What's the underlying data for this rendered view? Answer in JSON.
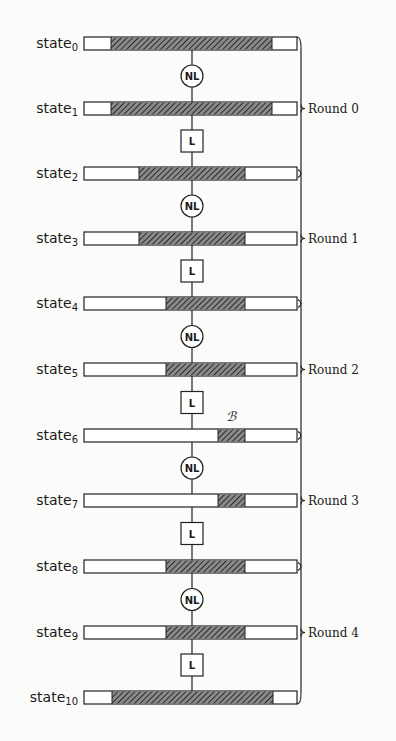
{
  "diagram": {
    "title": "",
    "layout": {
      "bar_x": 84,
      "bar_width": 213,
      "bar_height": 13,
      "center_x": 192,
      "brace_x": 301
    },
    "colors": {
      "stroke": "#222222",
      "hatch_bg": "#8a8a8a",
      "hatch_line": "#2a2a2a",
      "bar_fill": "#ffffff"
    },
    "states": [
      {
        "label": "state",
        "sub": "0",
        "y": 37,
        "hatch": [
          111,
          272
        ]
      },
      {
        "label": "state",
        "sub": "1",
        "y": 102,
        "hatch": [
          111,
          272
        ]
      },
      {
        "label": "state",
        "sub": "2",
        "y": 167,
        "hatch": [
          139,
          245
        ]
      },
      {
        "label": "state",
        "sub": "3",
        "y": 232,
        "hatch": [
          139,
          245
        ]
      },
      {
        "label": "state",
        "sub": "4",
        "y": 297,
        "hatch": [
          166,
          245
        ]
      },
      {
        "label": "state",
        "sub": "5",
        "y": 363,
        "hatch": [
          166,
          245
        ]
      },
      {
        "label": "state",
        "sub": "6",
        "y": 429,
        "hatch": [
          218,
          245
        ]
      },
      {
        "label": "state",
        "sub": "7",
        "y": 494,
        "hatch": [
          218,
          245
        ]
      },
      {
        "label": "state",
        "sub": "8",
        "y": 560,
        "hatch": [
          166,
          245
        ]
      },
      {
        "label": "state",
        "sub": "9",
        "y": 626,
        "hatch": [
          166,
          245
        ]
      },
      {
        "label": "state",
        "sub": "10",
        "y": 691,
        "hatch": [
          112,
          273
        ]
      }
    ],
    "operations": [
      {
        "type": "NL",
        "between": [
          0,
          1
        ]
      },
      {
        "type": "L",
        "between": [
          1,
          2
        ]
      },
      {
        "type": "NL",
        "between": [
          2,
          3
        ]
      },
      {
        "type": "L",
        "between": [
          3,
          4
        ]
      },
      {
        "type": "NL",
        "between": [
          4,
          5
        ]
      },
      {
        "type": "L",
        "between": [
          5,
          6
        ]
      },
      {
        "type": "NL",
        "between": [
          6,
          7
        ]
      },
      {
        "type": "L",
        "between": [
          7,
          8
        ]
      },
      {
        "type": "NL",
        "between": [
          8,
          9
        ]
      },
      {
        "type": "L",
        "between": [
          9,
          10
        ]
      }
    ],
    "rounds": [
      {
        "label": "Round 0",
        "at_state": 1
      },
      {
        "label": "Round 1",
        "at_state": 3
      },
      {
        "label": "Round 2",
        "at_state": 5
      },
      {
        "label": "Round 3",
        "at_state": 7
      },
      {
        "label": "Round 4",
        "at_state": 9
      }
    ],
    "annotation": {
      "label": "ℬ",
      "state": 6,
      "x": 231,
      "y": 421
    }
  }
}
